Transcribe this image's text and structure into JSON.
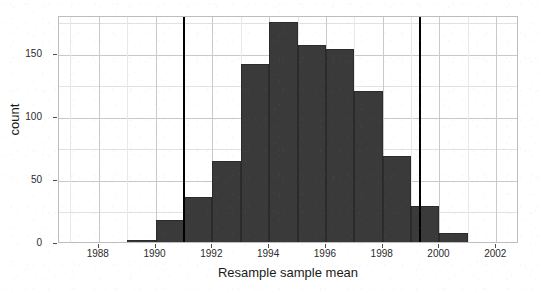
{
  "chart_data": {
    "type": "bar",
    "title": "",
    "subtitle": "",
    "xlabel": "Resample sample mean",
    "ylabel": "count",
    "xlim": [
      1986.6,
      2002.8
    ],
    "ylim": [
      0,
      180
    ],
    "grid": true,
    "legend": null,
    "bin_width": 1,
    "bar_color": "#3a3a3a",
    "annotation_line_color": "#000000",
    "xticks": [
      1988,
      1990,
      1992,
      1994,
      1996,
      1998,
      2000,
      2002
    ],
    "xtick_labels": [
      "1988",
      "1990",
      "1992",
      "1994",
      "1996",
      "1998",
      "2000",
      "2002"
    ],
    "xminor_ticks": [
      1987,
      1989,
      1991,
      1993,
      1995,
      1997,
      1999,
      2001
    ],
    "yticks": [
      0,
      50,
      100,
      150
    ],
    "ytick_labels": [
      "0",
      "50",
      "100",
      "150"
    ],
    "yminor_ticks": [
      25,
      75,
      125,
      175
    ],
    "bins": [
      {
        "left": 1989,
        "right": 1990,
        "count": 3
      },
      {
        "left": 1990,
        "right": 1991,
        "count": 19
      },
      {
        "left": 1991,
        "right": 1992,
        "count": 37
      },
      {
        "left": 1992,
        "right": 1993,
        "count": 66
      },
      {
        "left": 1993,
        "right": 1994,
        "count": 143
      },
      {
        "left": 1994,
        "right": 1995,
        "count": 176
      },
      {
        "left": 1995,
        "right": 1996,
        "count": 158
      },
      {
        "left": 1996,
        "right": 1997,
        "count": 155
      },
      {
        "left": 1997,
        "right": 1998,
        "count": 121
      },
      {
        "left": 1998,
        "right": 1999,
        "count": 70
      },
      {
        "left": 1999,
        "right": 2000,
        "count": 30
      },
      {
        "left": 2000,
        "right": 2001,
        "count": 9
      },
      {
        "left": 2001,
        "right": 2002,
        "count": 1
      }
    ],
    "categories": [
      "1989-1990",
      "1990-1991",
      "1991-1992",
      "1992-1993",
      "1993-1994",
      "1994-1995",
      "1995-1996",
      "1996-1997",
      "1997-1998",
      "1998-1999",
      "1999-2000",
      "2000-2001",
      "2001-2002"
    ],
    "values": [
      3,
      19,
      37,
      66,
      143,
      176,
      158,
      155,
      121,
      70,
      30,
      9,
      1
    ],
    "vertical_lines": [
      {
        "name": "lower-bound-line",
        "x": 1991.0
      },
      {
        "name": "upper-bound-line",
        "x": 1999.3
      }
    ]
  }
}
